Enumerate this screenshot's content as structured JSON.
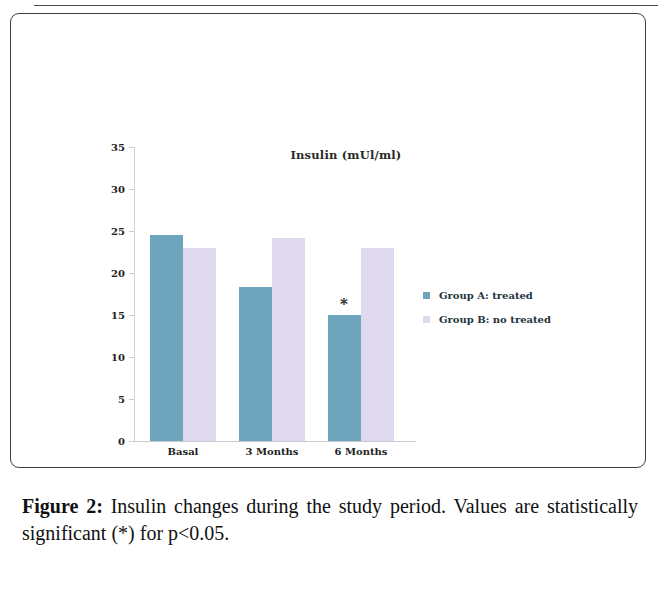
{
  "figure": {
    "caption_label": "Figure 2:",
    "caption_text": " Insulin changes during the study period. Values are statistically significant (*) for p<0.05."
  },
  "chart_data": {
    "type": "bar",
    "title": "Insulin (mUl/ml)",
    "xlabel": "",
    "ylabel": "",
    "ylim": [
      0,
      35
    ],
    "yticks": [
      0,
      5,
      10,
      15,
      20,
      25,
      30,
      35
    ],
    "ytick_labels": [
      "0",
      "5",
      "10",
      "15",
      "20",
      "25",
      "30",
      "35"
    ],
    "grid": false,
    "legend_position": "right",
    "categories": [
      "Basal",
      "3 Months",
      "6 Months"
    ],
    "series": [
      {
        "name": "Group A: treated",
        "color": "#6da5bd",
        "values": [
          24.5,
          18.3,
          15.0
        ]
      },
      {
        "name": "Group B: no treated",
        "color": "#ded9ec",
        "values": [
          23.0,
          24.2,
          23.0
        ]
      }
    ],
    "annotations": [
      {
        "text": "*",
        "category": "6 Months",
        "series": "Group A: treated",
        "value": 17.2,
        "note": "statistically significant"
      }
    ]
  }
}
